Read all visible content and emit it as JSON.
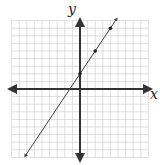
{
  "chart_data": {
    "type": "line",
    "title": "",
    "xlabel": "x",
    "ylabel": "y",
    "xlim": [
      -9,
      9
    ],
    "ylim": [
      -9,
      9
    ],
    "grid": true,
    "tick_labels": false,
    "series": [
      {
        "name": "line",
        "equation": "y = 1.5x + 2",
        "slope": 1.5,
        "intercept": 2,
        "marked_points": [
          {
            "x": 0,
            "y": 2
          },
          {
            "x": 2,
            "y": 5
          },
          {
            "x": 4,
            "y": 8
          }
        ],
        "arrows_both_ends": true
      }
    ]
  },
  "axes": {
    "x_label": "x",
    "y_label": "y"
  },
  "colors": {
    "grid": "#c8c8c8",
    "axis": "#333333",
    "line": "#444444"
  }
}
